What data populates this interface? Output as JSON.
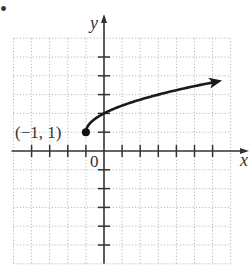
{
  "problem_marker": "•",
  "chart_data": {
    "type": "line",
    "title": "",
    "xlabel": "x",
    "ylabel": "y",
    "xlim": [
      -5,
      7
    ],
    "ylim": [
      -6,
      6
    ],
    "grid": true,
    "grid_style": "dotted",
    "function": "y = sqrt(x + 1) + 1",
    "start_point": {
      "x": -1,
      "y": 1,
      "label": "(−1, 1)",
      "filled": true
    },
    "end_arrow": true,
    "x": [
      -1,
      0,
      1,
      2,
      3,
      4,
      5,
      6
    ],
    "series": [
      {
        "name": "curve",
        "values": [
          1,
          2,
          2.41,
          2.73,
          3,
          3.24,
          3.45,
          3.65
        ]
      }
    ],
    "origin_label": "0",
    "x_ticks": [
      -4,
      -3,
      -2,
      -1,
      1,
      2,
      3,
      4,
      5,
      6
    ],
    "y_ticks": [
      -5,
      -4,
      -3,
      -2,
      -1,
      1,
      2,
      3,
      4,
      5
    ]
  },
  "labels": {
    "x_axis": "x",
    "y_axis": "y",
    "origin": "0",
    "point": "(−1, 1)"
  }
}
